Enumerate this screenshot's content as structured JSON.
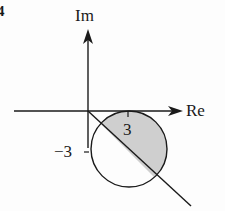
{
  "figure": {
    "number_label": "4",
    "axes": {
      "x_label": "Re",
      "y_label": "Im"
    },
    "ticks": {
      "x_tick": "3",
      "y_tick": "−3"
    },
    "shapes": {
      "circle": {
        "center": "3 - 3i",
        "radius": 3
      },
      "line": "through origin with slope -1",
      "shaded_region": "part of disk above/right of the line"
    },
    "colors": {
      "stroke": "#1a1a1a",
      "shade": "#cfcfcf"
    }
  }
}
